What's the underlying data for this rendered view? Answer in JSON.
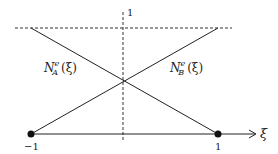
{
  "diagram": {
    "title": "",
    "axis": {
      "variable": "ξ",
      "tick_left": "−1",
      "tick_right": "1",
      "tick_top": "1"
    },
    "functions": [
      {
        "name": "N",
        "superscript": "e",
        "subscript": "A",
        "argument": "(ξ)"
      },
      {
        "name": "N",
        "superscript": "e",
        "subscript": "B",
        "argument": "(ξ)"
      }
    ],
    "nodes": [
      {
        "label": "−1"
      },
      {
        "label": "1"
      }
    ],
    "colors": {
      "line": "#222222",
      "dashed": "#333333",
      "background": "#ffffff"
    }
  }
}
